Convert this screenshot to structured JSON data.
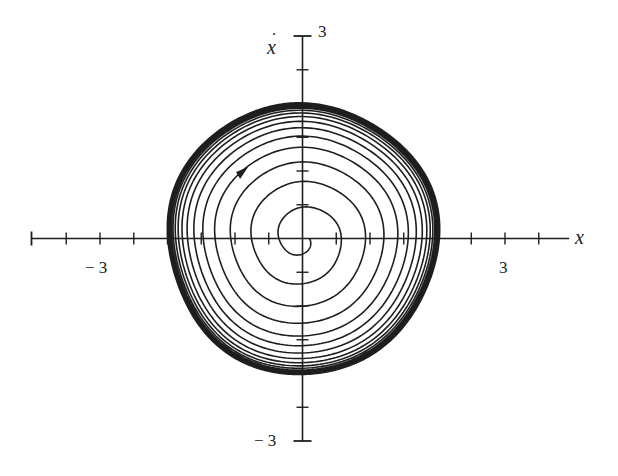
{
  "chart_data": {
    "type": "line",
    "title": "",
    "subtitle": "",
    "xlabel": "x",
    "ylabel": "ẋ",
    "xlim": [
      -4,
      4
    ],
    "ylim": [
      -3,
      3
    ],
    "grid": false,
    "legend": null,
    "x_ticks": {
      "major_step": 0.5,
      "values": [
        -4,
        -3.5,
        -3,
        -2.5,
        -2,
        -1.5,
        -1,
        -0.5,
        0.5,
        1,
        1.5,
        2,
        2.5,
        3,
        3.5
      ],
      "labels": [
        {
          "value": -3,
          "text": "− 3"
        },
        {
          "value": 3,
          "text": "3"
        }
      ]
    },
    "y_ticks": {
      "major_step": 0.5,
      "values": [
        -3,
        -2.5,
        -2,
        -1.5,
        -1,
        -0.5,
        0.5,
        1,
        1.5,
        2,
        2.5,
        3
      ],
      "labels": [
        {
          "value": 3,
          "text": "3"
        },
        {
          "value": -3,
          "text": "− 3"
        }
      ]
    },
    "series": [
      {
        "name": "trajectory spiraling outward to limit cycle",
        "kind": "spiral",
        "direction": "clockwise",
        "start_radius": 0.1,
        "limit_cycle_radius": 2.0,
        "turns": 15,
        "positive_x_crossings": [
          0.15,
          0.24,
          0.31,
          0.42,
          0.6,
          0.99,
          1.23,
          1.48,
          1.63,
          1.72,
          1.85,
          1.93,
          1.98,
          2.0
        ],
        "positive_y_crossings": [
          0.08,
          0.16,
          0.28,
          0.45,
          0.74,
          1.06,
          1.33,
          1.57,
          1.76,
          1.87,
          1.96,
          2.0
        ]
      },
      {
        "name": "limit cycle",
        "kind": "closed-orbit",
        "x_extent": [
          -1.97,
          2.0
        ],
        "y_extent": [
          -1.99,
          2.0
        ]
      }
    ],
    "annotations": [
      {
        "type": "arrow",
        "x": -0.91,
        "y": 0.97,
        "direction": "up-right (clockwise flow)"
      }
    ]
  },
  "labels": {
    "y_axis": "ẋ",
    "y_axis_base": "x",
    "y_top": "3",
    "y_bottom": "− 3",
    "x_neg": "− 3",
    "x_pos": "3",
    "x_axis": "x"
  },
  "style": {
    "ink": "#1e1e1e",
    "background": "#ffffff"
  }
}
